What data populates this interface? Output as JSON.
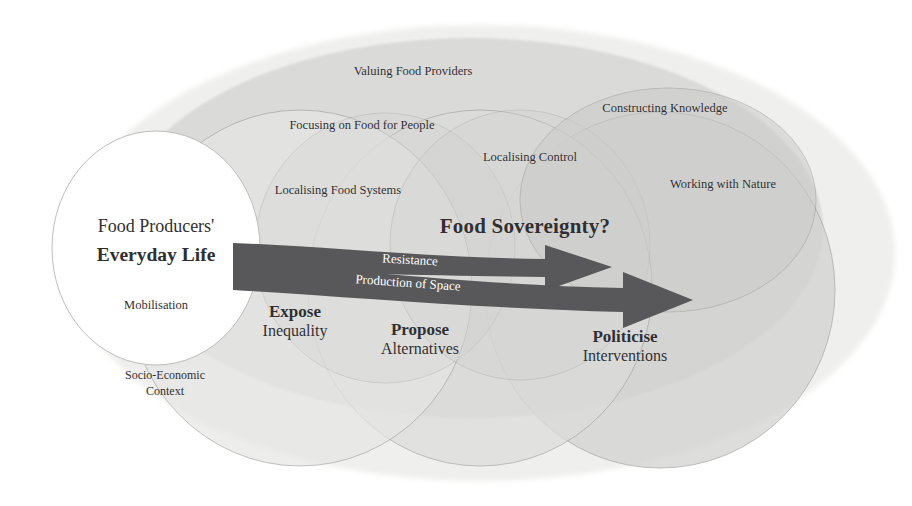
{
  "diagram": {
    "title_text": "Food Sovereignty?",
    "core": {
      "line1": "Food Producers'",
      "line2": "Everyday Life",
      "line3": "Mobilisation"
    },
    "context_label": {
      "line1": "Socio-Economic",
      "line2": "Context"
    },
    "pillars": [
      {
        "id": "valuing-food-providers",
        "label": "Valuing Food Providers"
      },
      {
        "id": "focusing-on-food-for-people",
        "label": "Focusing on Food for People"
      },
      {
        "id": "constructing-knowledge",
        "label": "Constructing Knowledge"
      },
      {
        "id": "localising-control",
        "label": "Localising Control"
      },
      {
        "id": "localising-food-systems",
        "label": "Localising Food Systems"
      },
      {
        "id": "working-with-nature",
        "label": "Working with Nature"
      }
    ],
    "arrow_labels": [
      {
        "id": "resistance",
        "label": "Resistance"
      },
      {
        "id": "production-of-space",
        "label": "Production of Space"
      }
    ],
    "actions": [
      {
        "id": "expose",
        "verb": "Expose",
        "object": "Inequality"
      },
      {
        "id": "propose",
        "verb": "Propose",
        "object": "Alternatives"
      },
      {
        "id": "politicise",
        "verb": "Politicise",
        "object": "Interventions"
      }
    ],
    "colors": {
      "background": "#ffffff",
      "outer_field": "#eeeeec",
      "shade_light": "#e4e4e2",
      "shade_mid": "#d8d8d6",
      "shade_dark": "#cfcfcd",
      "core_fill": "#ffffff",
      "stroke": "#9b9b9b",
      "arrow_fill": "#58585a",
      "text": "#2f2f31",
      "arrow_text": "#ffffff"
    }
  }
}
